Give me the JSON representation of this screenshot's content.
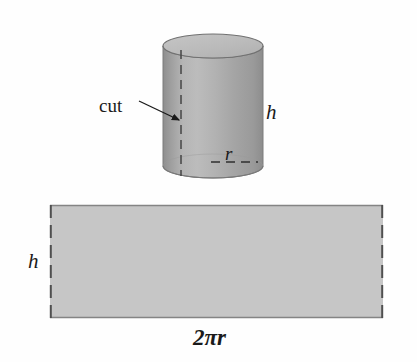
{
  "figure": {
    "background_color": "#fefefe",
    "labels": {
      "cut": "cut",
      "height_cylinder": "h",
      "radius": "r",
      "height_rectangle": "h",
      "circumference": "2πr",
      "circumference_coefficient": "2",
      "circumference_pi": "π",
      "circumference_radius": "r"
    },
    "colors": {
      "cylinder_body_light": "#b9b9b9",
      "cylinder_body_mid": "#a9a9a9",
      "cylinder_body_dark": "#8f8f8f",
      "cylinder_top_fill": "#bdbdbd",
      "rectangle_fill": "#c6c6c6",
      "outline": "#6f6f6f",
      "dashed_line": "#4a4a4a",
      "arrow": "#1a1a1a",
      "text": "#1a1a1a"
    },
    "shapes": {
      "cylinder": {
        "name": "cylinder",
        "left": 163,
        "right": 263,
        "top_ellipse_center_y": 46,
        "bottom_ellipse_center_y": 166,
        "ellipse_rx": 50,
        "ellipse_ry": 12,
        "height": 120
      },
      "cut_line": {
        "name": "cut-dashed-line",
        "x": 181,
        "y_top": 50,
        "y_bottom": 176
      },
      "radius_line": {
        "name": "radius-dashed-line",
        "x_start": 212,
        "x_end": 257,
        "y": 162
      },
      "cut_arrow": {
        "name": "cut-arrow",
        "x_start": 139,
        "y_start": 102,
        "x_end": 180,
        "y_end": 120
      },
      "rectangle": {
        "name": "unrolled-rectangle",
        "left": 50,
        "top": 205,
        "right": 383,
        "bottom": 318,
        "width": 333,
        "height": 113
      }
    }
  }
}
